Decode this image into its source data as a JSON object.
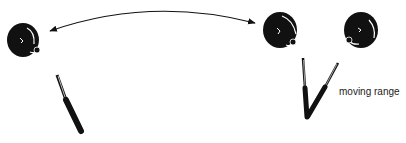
{
  "diagram": {
    "labels": {
      "moving_range": "moving range"
    },
    "elements": [
      {
        "type": "knob",
        "name": "knob-left"
      },
      {
        "type": "knob",
        "name": "knob-center"
      },
      {
        "type": "knob",
        "name": "knob-right"
      },
      {
        "type": "stick",
        "name": "stick-left"
      },
      {
        "type": "stick-pair",
        "name": "stick-range"
      },
      {
        "type": "double-arrow",
        "name": "arc-arrow"
      }
    ],
    "colors": {
      "ink": "#111111",
      "background": "#ffffff"
    }
  }
}
